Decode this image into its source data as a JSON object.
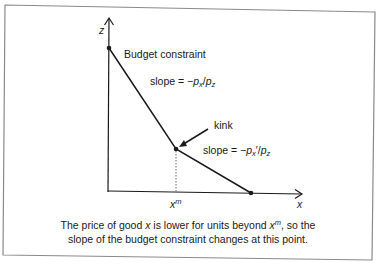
{
  "diagram": {
    "axes": {
      "y_label": "z",
      "x_label": "x"
    },
    "labels": {
      "budget_constraint": "Budget constraint",
      "kink": "kink",
      "xm_base": "x",
      "xm_sup": "m"
    },
    "slope1": {
      "prefix": "slope = −",
      "p1": "p",
      "p1_sub": "x",
      "slash": "/",
      "p2": "p",
      "p2_sub": "z"
    },
    "slope2": {
      "prefix": "slope = −",
      "p1": "p",
      "p1_sub": "x",
      "prime": "′",
      "slash": "/",
      "p2": "p",
      "p2_sub": "z"
    },
    "caption": {
      "line1_a": "The price of good ",
      "line1_x": "x",
      "line1_b": " is lower for units beyond ",
      "line1_xm": "x",
      "line1_xm_sup": "m",
      "line1_c": ", so the",
      "line2": "slope of the budget constraint changes at this point."
    },
    "colors": {
      "line": "#1a1a1a",
      "frame": "#8a8a8a",
      "dotted": "#555555"
    }
  }
}
